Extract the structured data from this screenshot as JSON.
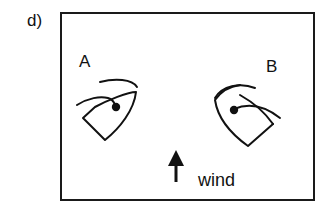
{
  "figure": {
    "panel_label": "d)",
    "boats": [
      {
        "label": "A",
        "heading": "tilted right, bow up-right"
      },
      {
        "label": "B",
        "heading": "tilted left, bow up-left"
      }
    ],
    "wind": {
      "label": "wind",
      "direction": "up"
    },
    "colors": {
      "stroke": "#111111",
      "background": "#ffffff"
    }
  }
}
